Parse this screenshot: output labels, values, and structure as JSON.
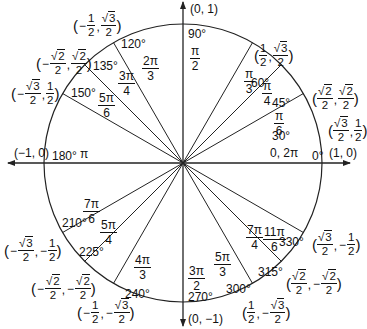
{
  "diagram": {
    "center": [
      183,
      163
    ],
    "radius": 139,
    "line_color": "#222222",
    "axis_endpoints": {
      "top": "(0, 1)",
      "bottom": "(0, −1)",
      "left": "(−1, 0)",
      "right": "(1, 0)"
    },
    "axis_angles": {
      "deg_0": "0°",
      "rad_0": "0, 2π",
      "deg_90": "90°",
      "rad_90": {
        "num": "π",
        "den": "2"
      },
      "deg_180": "180°",
      "rad_180": "π",
      "deg_270": "270°",
      "rad_270": {
        "num": "3π",
        "den": "2"
      }
    },
    "angles": [
      {
        "deg": "30°",
        "rad": {
          "num": "π",
          "den": "6"
        },
        "x": {
          "sign": "",
          "num": "3",
          "sqrt": true,
          "den": "2"
        },
        "y": {
          "sign": "",
          "num": "1",
          "sqrt": false,
          "den": "2"
        }
      },
      {
        "deg": "45°",
        "rad": {
          "num": "π",
          "den": "4"
        },
        "x": {
          "sign": "",
          "num": "2",
          "sqrt": true,
          "den": "2"
        },
        "y": {
          "sign": "",
          "num": "2",
          "sqrt": true,
          "den": "2"
        }
      },
      {
        "deg": "60°",
        "rad": {
          "num": "π",
          "den": "3"
        },
        "x": {
          "sign": "",
          "num": "1",
          "sqrt": false,
          "den": "2"
        },
        "y": {
          "sign": "",
          "num": "3",
          "sqrt": true,
          "den": "2"
        }
      },
      {
        "deg": "120°",
        "rad": {
          "num": "2π",
          "den": "3"
        },
        "x": {
          "sign": "−",
          "num": "1",
          "sqrt": false,
          "den": "2"
        },
        "y": {
          "sign": "",
          "num": "3",
          "sqrt": true,
          "den": "2"
        }
      },
      {
        "deg": "135°",
        "rad": {
          "num": "3π",
          "den": "4"
        },
        "x": {
          "sign": "−",
          "num": "2",
          "sqrt": true,
          "den": "2"
        },
        "y": {
          "sign": "",
          "num": "2",
          "sqrt": true,
          "den": "2"
        }
      },
      {
        "deg": "150°",
        "rad": {
          "num": "5π",
          "den": "6"
        },
        "x": {
          "sign": "−",
          "num": "3",
          "sqrt": true,
          "den": "2"
        },
        "y": {
          "sign": "",
          "num": "1",
          "sqrt": false,
          "den": "2"
        }
      },
      {
        "deg": "210°",
        "rad": {
          "num": "7π",
          "den": "6"
        },
        "x": {
          "sign": "−",
          "num": "3",
          "sqrt": true,
          "den": "2"
        },
        "y": {
          "sign": "−",
          "num": "1",
          "sqrt": false,
          "den": "2"
        }
      },
      {
        "deg": "225°",
        "rad": {
          "num": "5π",
          "den": "4"
        },
        "x": {
          "sign": "−",
          "num": "2",
          "sqrt": true,
          "den": "2"
        },
        "y": {
          "sign": "−",
          "num": "2",
          "sqrt": true,
          "den": "2"
        }
      },
      {
        "deg": "240°",
        "rad": {
          "num": "4π",
          "den": "3"
        },
        "x": {
          "sign": "−",
          "num": "1",
          "sqrt": false,
          "den": "2"
        },
        "y": {
          "sign": "−",
          "num": "3",
          "sqrt": true,
          "den": "2"
        }
      },
      {
        "deg": "300°",
        "rad": {
          "num": "5π",
          "den": "3"
        },
        "x": {
          "sign": "",
          "num": "1",
          "sqrt": false,
          "den": "2"
        },
        "y": {
          "sign": "−",
          "num": "3",
          "sqrt": true,
          "den": "2"
        }
      },
      {
        "deg": "315°",
        "rad": {
          "num": "7π",
          "den": "4"
        },
        "x": {
          "sign": "",
          "num": "2",
          "sqrt": true,
          "den": "2"
        },
        "y": {
          "sign": "−",
          "num": "2",
          "sqrt": true,
          "den": "2"
        }
      },
      {
        "deg": "330°",
        "rad": {
          "num": "11π",
          "den": "6"
        },
        "x": {
          "sign": "",
          "num": "3",
          "sqrt": true,
          "den": "2"
        },
        "y": {
          "sign": "−",
          "num": "1",
          "sqrt": false,
          "den": "2"
        }
      }
    ]
  }
}
